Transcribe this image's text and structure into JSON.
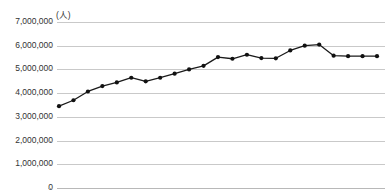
{
  "chart_data": {
    "type": "line",
    "title": "",
    "subtitle": "",
    "unit_label": "(人)",
    "xlabel": "",
    "ylabel": "",
    "ylim": [
      0,
      7000000
    ],
    "ytick_labels": [
      "7,000,000",
      "6,000,000",
      "5,000,000",
      "4,000,000",
      "3,000,000",
      "2,000,000",
      "1,000,000",
      "0"
    ],
    "ytick_values": [
      7000000,
      6000000,
      5000000,
      4000000,
      3000000,
      2000000,
      1000000,
      0
    ],
    "grid": true,
    "legend": false,
    "legend_position": "none",
    "x": [
      1,
      2,
      3,
      4,
      5,
      6,
      7,
      8,
      9,
      10,
      11,
      12,
      13,
      14,
      15,
      16,
      17,
      18,
      19,
      20,
      21,
      22,
      23
    ],
    "xtick_labels": [],
    "values": [
      3450000,
      3700000,
      4070000,
      4300000,
      4450000,
      4650000,
      4500000,
      4650000,
      4820000,
      5000000,
      5150000,
      5520000,
      5450000,
      5620000,
      5480000,
      5470000,
      5800000,
      6000000,
      6050000,
      5580000,
      5560000,
      5560000,
      5560000
    ],
    "series": [
      {
        "name": "",
        "color": "#1a1a1a",
        "marker": "circle",
        "values": [
          3450000,
          3700000,
          4070000,
          4300000,
          4450000,
          4650000,
          4500000,
          4650000,
          4820000,
          5000000,
          5150000,
          5520000,
          5450000,
          5620000,
          5480000,
          5470000,
          5800000,
          6000000,
          6050000,
          5580000,
          5560000,
          5560000,
          5560000
        ]
      }
    ],
    "colors": {
      "line": "#1a1a1a",
      "marker": "#111111",
      "gridline": "#c9c9c9",
      "tick_text": "#333333",
      "background": "#ffffff"
    }
  }
}
